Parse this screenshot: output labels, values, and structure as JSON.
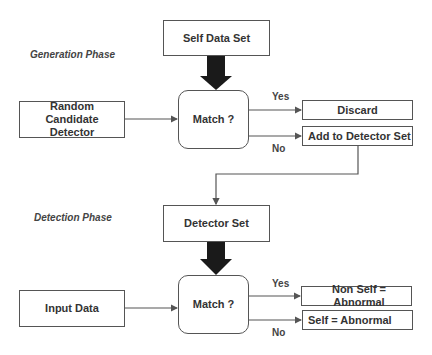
{
  "generation_phase": {
    "title": "Generation Phase",
    "self_data_set": "Self Data Set",
    "random_candidate_detector": "Random Candidate Detector",
    "match": "Match ?",
    "yes_label": "Yes",
    "no_label": "No",
    "discard": "Discard",
    "add_to_detector_set": "Add to Detector Set"
  },
  "detection_phase": {
    "title": "Detection Phase",
    "detector_set": "Detector Set",
    "input_data": "Input Data",
    "match": "Match ?",
    "yes_label": "Yes",
    "no_label": "No",
    "non_self_abnormal": "Non Self = Abnormal",
    "self_abnormal": "Self = Abnormal"
  },
  "colors": {
    "stroke": "#555555",
    "thick_arrow": "#1a1a1a",
    "text": "#333333"
  }
}
